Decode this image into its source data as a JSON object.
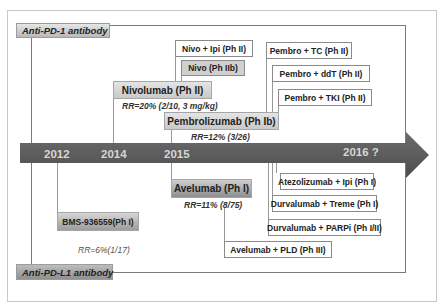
{
  "diagram": {
    "groups": {
      "pd1": {
        "label": "Anti-PD-1 antibody"
      },
      "pdl1": {
        "label": "Anti-PD-L1 antibody"
      }
    },
    "timeline": {
      "years": [
        "2012",
        "2014",
        "2015",
        "2016 ?"
      ],
      "arrow_color": "#5f5f5f"
    },
    "pd1_items": {
      "nivolumab": {
        "label": "Nivolumab (Ph II)",
        "rr": "RR=20% (2/10, 3 mg/kg)"
      },
      "pembrolizumab": {
        "label": "Pembrolizumab (Ph Ib)",
        "rr": "RR=12% (3/26)"
      },
      "nivo_ipi": {
        "label": "Nivo + Ipi (Ph II)"
      },
      "nivo_iib": {
        "label": "Nivo (Ph IIb)"
      },
      "pembro_tc": {
        "label": "Pembro + TC (Ph II)"
      },
      "pembro_ddt": {
        "label": "Pembro + ddT (Ph II)"
      },
      "pembro_tki": {
        "label": "Pembro + TKI (Ph II)"
      }
    },
    "pdl1_items": {
      "bms": {
        "label": "BMS-936559(Ph I)",
        "rr": "RR=6%(1/17)"
      },
      "avelumab": {
        "label": "Avelumab (Ph I)",
        "rr": "RR=11% (8/75)"
      },
      "atezo_ipi": {
        "label": "Atezolizumab + Ipi (Ph I)"
      },
      "durva_treme": {
        "label": "Durvalumab + Treme (Ph I)"
      },
      "durva_parpi": {
        "label": "Durvalumab + PARPi (Ph I/II)"
      },
      "avelumab_pld": {
        "label": "Avelumab + PLD (Ph III)"
      }
    }
  }
}
